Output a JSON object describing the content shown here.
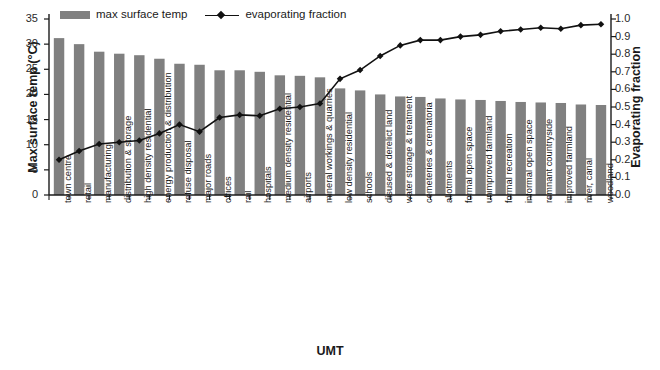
{
  "chart_data": {
    "type": "bar",
    "title": "",
    "xlabel": "UMT",
    "ylabel": "Max surface temp (°C)",
    "y2label": "Evaporating fraction",
    "ylim": [
      0,
      35
    ],
    "y2lim": [
      0.0,
      1.0
    ],
    "grid": false,
    "legend_position": "top",
    "categories": [
      "town centre",
      "retail",
      "manufacturing",
      "distribution & storage",
      "high density residential",
      "energy production & distribution",
      "refuse disposal",
      "major roads",
      "offices",
      "rail",
      "hospitals",
      "medium density residential",
      "airports",
      "mineral workings & quarries",
      "low density residential",
      "schools",
      "disused & derelict land",
      "water storage & treatment",
      "cemeteries & crematoria",
      "allotments",
      "formal open space",
      "unimproved farmland",
      "formal recreation",
      "informal open space",
      "remnant countryside",
      "improved farmland",
      "river, canal",
      "woodland"
    ],
    "series": [
      {
        "name": "max surface temp",
        "axis": "left",
        "render": "bar",
        "color": "#808080",
        "unit": "°C",
        "values": [
          31.2,
          30.0,
          28.5,
          28.1,
          27.8,
          27.1,
          26.1,
          25.9,
          24.8,
          24.8,
          24.5,
          23.8,
          23.7,
          23.4,
          21.2,
          20.8,
          20.0,
          19.6,
          19.5,
          19.2,
          19.0,
          18.9,
          18.7,
          18.5,
          18.4,
          18.3,
          18.0,
          17.9
        ]
      },
      {
        "name": "evaporating fraction",
        "axis": "right",
        "render": "line",
        "color": "#111111",
        "marker": "diamond",
        "values": [
          0.2,
          0.25,
          0.29,
          0.3,
          0.31,
          0.35,
          0.4,
          0.36,
          0.44,
          0.455,
          0.45,
          0.49,
          0.5,
          0.52,
          0.66,
          0.71,
          0.79,
          0.85,
          0.88,
          0.88,
          0.9,
          0.91,
          0.93,
          0.94,
          0.95,
          0.945,
          0.965,
          0.97
        ]
      }
    ],
    "y_ticks": [
      "0",
      "5",
      "10",
      "15",
      "20",
      "25",
      "30",
      "35"
    ],
    "y2_ticks": [
      "0.0",
      "0.1",
      "0.2",
      "0.3",
      "0.4",
      "0.5",
      "0.6",
      "0.7",
      "0.8",
      "0.9",
      "1.0"
    ]
  },
  "legend": {
    "bar_label": "max surface temp",
    "line_label": "evaporating fraction"
  }
}
